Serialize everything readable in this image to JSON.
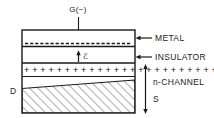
{
  "diagram": {
    "type": "semiconductor-device-cross-section",
    "gate": {
      "terminal_label": "G(−)",
      "polarity": "negative"
    },
    "terminals": {
      "drain_label": "D",
      "source_label": "S"
    },
    "field": {
      "symbol": "ℰ",
      "direction": "up"
    },
    "layers": [
      {
        "key": "metal",
        "label": "METAL"
      },
      {
        "key": "insulator",
        "label": "INSULATOR"
      },
      {
        "key": "channel",
        "label": "n-CHANNEL"
      }
    ],
    "charges": {
      "induced_positive_symbol": "+",
      "induced_positive_count": 26,
      "gate_negative_symbol": "−",
      "gate_negative_count": 26
    },
    "colors": {
      "line": "#1a1a1a",
      "text": "#1a1a1a",
      "background": "#ffffff",
      "hatch": "#6a6a6a"
    }
  }
}
